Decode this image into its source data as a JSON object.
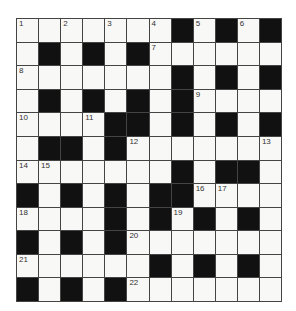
{
  "puzzle": {
    "rows": 12,
    "cols": 12,
    "colors": {
      "black": "#111111",
      "white": "#f8f8f6",
      "line": "#444444"
    },
    "grid": [
      [
        "1",
        ".",
        "2",
        ".",
        "3",
        ".",
        "4",
        "#",
        "5",
        "#",
        "6",
        "#"
      ],
      [
        ".",
        "#",
        ".",
        "#",
        ".",
        "#",
        "7",
        ".",
        ".",
        ".",
        ".",
        "."
      ],
      [
        "8",
        ".",
        ".",
        ".",
        ".",
        ".",
        ".",
        "#",
        ".",
        "#",
        ".",
        "#"
      ],
      [
        ".",
        "#",
        ".",
        "#",
        ".",
        "#",
        ".",
        "#",
        "9",
        ".",
        ".",
        "."
      ],
      [
        "10",
        ".",
        ".",
        "11",
        "#",
        "#",
        ".",
        "#",
        ".",
        "#",
        ".",
        "#"
      ],
      [
        ".",
        "#",
        "#",
        ".",
        "#",
        "12",
        ".",
        ".",
        ".",
        ".",
        ".",
        "13"
      ],
      [
        "14",
        "15",
        ".",
        ".",
        ".",
        ".",
        ".",
        "#",
        ".",
        "#",
        "#",
        "."
      ],
      [
        "#",
        ".",
        "#",
        ".",
        "#",
        ".",
        "#",
        "#",
        "16",
        "17",
        ".",
        "."
      ],
      [
        "18",
        ".",
        ".",
        ".",
        "#",
        ".",
        "#",
        "19",
        "#",
        ".",
        "#",
        "."
      ],
      [
        "#",
        ".",
        "#",
        ".",
        "#",
        "20",
        ".",
        ".",
        ".",
        ".",
        ".",
        "."
      ],
      [
        "21",
        ".",
        ".",
        ".",
        ".",
        ".",
        "#",
        ".",
        "#",
        ".",
        "#",
        "."
      ],
      [
        "#",
        ".",
        "#",
        ".",
        "#",
        "22",
        ".",
        ".",
        ".",
        ".",
        ".",
        "."
      ]
    ],
    "clue_numbers": [
      "1",
      "2",
      "3",
      "4",
      "5",
      "6",
      "7",
      "8",
      "9",
      "10",
      "11",
      "12",
      "13",
      "14",
      "15",
      "16",
      "17",
      "18",
      "19",
      "20",
      "21",
      "22"
    ]
  }
}
